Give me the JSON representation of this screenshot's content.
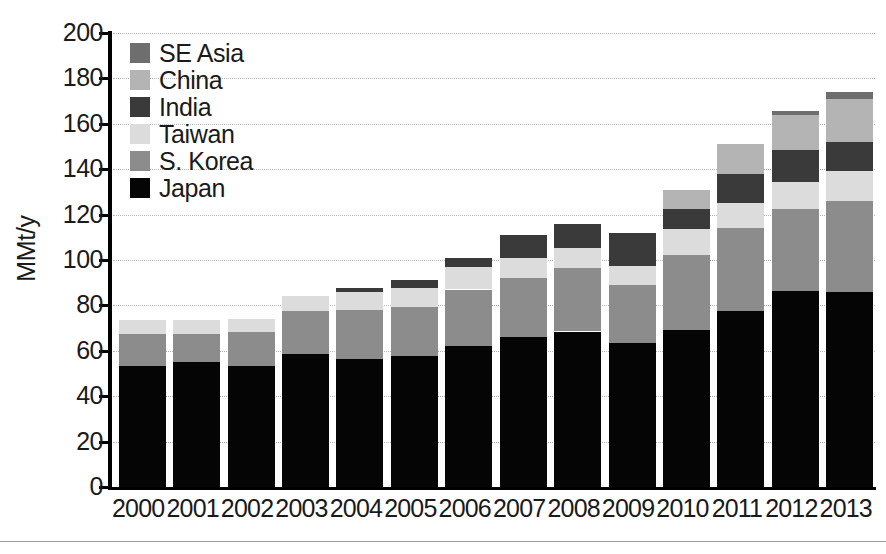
{
  "chart_data": {
    "type": "bar",
    "subtype": "stacked-bar",
    "title": "",
    "xlabel": "",
    "ylabel": "MMt/y",
    "ylim": [
      0,
      200
    ],
    "yticks": [
      0,
      20,
      40,
      60,
      80,
      100,
      120,
      140,
      160,
      180,
      200
    ],
    "ytick_labels": [
      "0",
      "20",
      "40",
      "60",
      "80",
      "100",
      "120",
      "140",
      "160",
      "180",
      "200"
    ],
    "grid": true,
    "grid_style": "dotted-horizontal",
    "legend_position": "top-left-inside",
    "categories": [
      "2000",
      "2001",
      "2002",
      "2003",
      "2004",
      "2005",
      "2006",
      "2007",
      "2008",
      "2009",
      "2010",
      "2011",
      "2012",
      "2013"
    ],
    "stack_order_bottom_to_top": [
      "Japan",
      "S. Korea",
      "Taiwan",
      "India",
      "China",
      "SE Asia"
    ],
    "series": [
      {
        "name": "Japan",
        "color": "#050505",
        "values": [
          53.5,
          55,
          53.5,
          58.5,
          56.5,
          57.5,
          62,
          66,
          68.5,
          63.5,
          69,
          77.5,
          86.5,
          86
        ]
      },
      {
        "name": "S. Korea",
        "color": "#8c8c8c",
        "values": [
          14,
          12.5,
          15,
          19,
          21.5,
          22,
          25,
          26,
          28,
          25.5,
          33,
          36.5,
          36,
          40
        ]
      },
      {
        "name": "Taiwan",
        "color": "#dcdcdc",
        "values": [
          6,
          6,
          5.5,
          6.5,
          8,
          8,
          10,
          9,
          9,
          8.5,
          11.5,
          11,
          12,
          13
        ]
      },
      {
        "name": "India",
        "color": "#3a3a3a",
        "values": [
          0,
          0,
          0,
          0,
          1.5,
          3.5,
          4,
          10,
          10.5,
          14.5,
          9,
          13,
          14,
          13
        ]
      },
      {
        "name": "China",
        "color": "#b4b4b4",
        "values": [
          0,
          0,
          0,
          0,
          0,
          0,
          0,
          0,
          0,
          0,
          8.5,
          13,
          15.5,
          19
        ]
      },
      {
        "name": "SE Asia",
        "color": "#6e6e6e",
        "values": [
          0,
          0,
          0,
          0,
          0,
          0,
          0,
          0,
          0,
          0,
          0,
          0,
          1.5,
          3
        ]
      }
    ],
    "totals": [
      73.5,
      73.5,
      74,
      84,
      87.5,
      91,
      101,
      111,
      116,
      112,
      131,
      151,
      165.5,
      174
    ],
    "annotations": []
  },
  "legend": {
    "entries": [
      {
        "label": "SE Asia",
        "color": "#6e6e6e"
      },
      {
        "label": "China",
        "color": "#b4b4b4"
      },
      {
        "label": "India",
        "color": "#3a3a3a"
      },
      {
        "label": "Taiwan",
        "color": "#dcdcdc"
      },
      {
        "label": "S. Korea",
        "color": "#8c8c8c"
      },
      {
        "label": "Japan",
        "color": "#050505"
      }
    ]
  }
}
